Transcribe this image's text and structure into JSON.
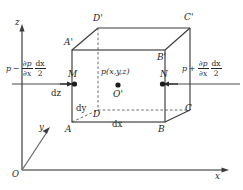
{
  "figure": {
    "type": "fluid-element-pressure-diagram",
    "axes": {
      "x_label": "x",
      "y_label": "y",
      "z_label": "z",
      "origin_label": "O"
    },
    "cube": {
      "vertices": {
        "front_bottom_left": "A",
        "front_bottom_right": "B",
        "front_top_left": "A'",
        "front_top_right": "B'",
        "back_bottom_left": "D",
        "back_bottom_right": "C",
        "back_top_left": "D'",
        "back_top_right": "C'"
      },
      "dimensions": {
        "dx": "dx",
        "dy": "dy",
        "dz": "dz"
      }
    },
    "center": {
      "pressure_label": "p(x,y,z)",
      "point_label": "O'"
    },
    "faces": {
      "left": {
        "point_label": "M",
        "pressure": {
          "base": "p",
          "operator": "−",
          "partial_num": "∂p",
          "partial_den": "∂x",
          "frac_num": "dx",
          "frac_den": "2"
        }
      },
      "right": {
        "point_label": "N",
        "pressure": {
          "base": "p",
          "operator": "+",
          "partial_num": "∂p",
          "partial_den": "∂x",
          "frac_num": "dx",
          "frac_den": "2"
        }
      }
    },
    "colors": {
      "line": "#3c3c3c",
      "axis": "#6b6b6b",
      "text": "#262626"
    }
  }
}
